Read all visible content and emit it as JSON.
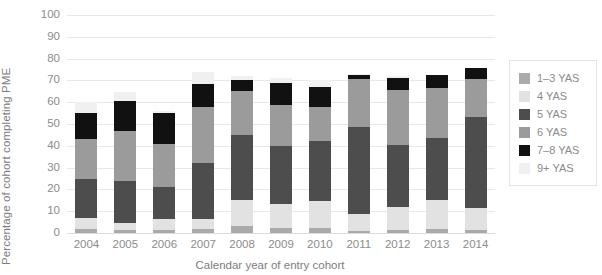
{
  "chart_data": {
    "type": "bar",
    "stacked": true,
    "title": "",
    "xlabel": "Calendar year of entry cohort",
    "ylabel": "Percentage of cohort completing PME",
    "categories": [
      "2004",
      "2005",
      "2006",
      "2007",
      "2008",
      "2009",
      "2010",
      "2011",
      "2012",
      "2013",
      "2014"
    ],
    "ylim": [
      0,
      100
    ],
    "yticks": [
      0,
      10,
      20,
      30,
      40,
      50,
      60,
      70,
      80,
      90,
      100
    ],
    "grid": true,
    "legend_position": "right",
    "series": [
      {
        "name": "1–3 YAS",
        "color": "#aaaaaa",
        "values": [
          2.0,
          1.5,
          1.5,
          2.0,
          3.0,
          2.5,
          2.5,
          1.0,
          1.5,
          2.0,
          1.5
        ]
      },
      {
        "name": "4 YAS",
        "color": "#e2e2e2",
        "values": [
          5.0,
          3.0,
          5.0,
          4.5,
          12.0,
          11.0,
          12.0,
          7.5,
          10.5,
          13.0,
          10.0
        ]
      },
      {
        "name": "5 YAS",
        "color": "#4d4d4d",
        "values": [
          18.0,
          19.5,
          14.5,
          25.5,
          30.0,
          26.5,
          27.5,
          40.0,
          28.5,
          28.5,
          41.5
        ]
      },
      {
        "name": "6 YAS",
        "color": "#9b9b9b",
        "values": [
          18.0,
          23.0,
          20.0,
          26.0,
          20.0,
          18.5,
          16.0,
          22.0,
          25.0,
          23.0,
          17.5
        ]
      },
      {
        "name": "7–8 YAS",
        "color": "#111111",
        "values": [
          12.0,
          13.5,
          14.0,
          10.5,
          5.0,
          10.5,
          9.0,
          2.0,
          5.5,
          6.0,
          5.0
        ]
      },
      {
        "name": "9+ YAS",
        "color": "#f0f0f0",
        "values": [
          5.0,
          4.0,
          1.0,
          5.5,
          2.0,
          2.0,
          3.0,
          0.5,
          1.0,
          0.0,
          0.0
        ]
      }
    ],
    "totals": [
      60.0,
      64.5,
      56.0,
      74.0,
      72.0,
      71.0,
      70.0,
      73.0,
      72.0,
      72.5,
      75.5
    ]
  },
  "legend": {
    "items": [
      {
        "label": "1–3 YAS",
        "color": "#aaaaaa"
      },
      {
        "label": "4 YAS",
        "color": "#e2e2e2"
      },
      {
        "label": "5 YAS",
        "color": "#4d4d4d"
      },
      {
        "label": "6 YAS",
        "color": "#9b9b9b"
      },
      {
        "label": "7–8 YAS",
        "color": "#111111"
      },
      {
        "label": "9+ YAS",
        "color": "#f0f0f0"
      }
    ]
  }
}
